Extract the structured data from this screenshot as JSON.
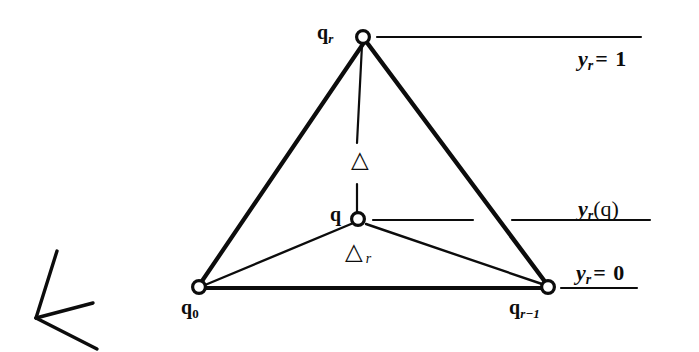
{
  "figure": {
    "background_color": "#ffffff",
    "ink_color": "#0c0c0c"
  },
  "vertices": [
    {
      "id": "q_r",
      "name": "apex-vertex",
      "label_main": "q",
      "label_sub": "r",
      "sub_style": "italic",
      "x": 363,
      "y": 37,
      "label_x": 317,
      "label_y": 22
    },
    {
      "id": "q",
      "name": "interior-vertex",
      "label_main": "q",
      "label_sub": "",
      "sub_style": "none",
      "x": 358,
      "y": 219,
      "label_x": 330,
      "label_y": 204
    },
    {
      "id": "q_0",
      "name": "base-left-vertex",
      "label_main": "q",
      "label_sub": "0",
      "sub_style": "upright",
      "x": 199,
      "y": 287,
      "label_x": 181,
      "label_y": 297
    },
    {
      "id": "q_r-1",
      "name": "base-right-vertex",
      "label_main": "q",
      "label_sub": "r−1",
      "sub_style": "italic",
      "x": 548,
      "y": 287,
      "label_x": 509,
      "label_y": 297
    }
  ],
  "simplex_labels": [
    {
      "id": "delta",
      "name": "simplex-delta-label",
      "glyph": "△",
      "sub": "",
      "x": 351,
      "y": 148
    },
    {
      "id": "delta_r",
      "name": "simplex-delta-r-label",
      "glyph": "△",
      "sub": "r",
      "x": 345,
      "y": 240
    }
  ],
  "level_lines": [
    {
      "id": "y_r_eq_1",
      "name": "level-line-top",
      "label_main": "y",
      "label_sub": "r",
      "label_rest": "= 1",
      "label_x": 578,
      "label_y": 48,
      "segments": [
        {
          "x1": 377,
          "y1": 37,
          "x2": 641,
          "y2": 37
        }
      ]
    },
    {
      "id": "y_r_of_q",
      "name": "level-line-middle",
      "label_main": "y",
      "label_sub": "r",
      "label_rest": "(q)",
      "label_x": 578,
      "label_y": 198,
      "segments": [
        {
          "x1": 373,
          "y1": 220,
          "x2": 473,
          "y2": 220
        },
        {
          "x1": 512,
          "y1": 220,
          "x2": 650,
          "y2": 220
        }
      ]
    },
    {
      "id": "y_r_eq_0",
      "name": "level-line-bottom",
      "label_main": "y",
      "label_sub": "r",
      "label_rest": "= 0",
      "label_x": 576,
      "label_y": 262,
      "segments": [
        {
          "x1": 561,
          "y1": 288,
          "x2": 637,
          "y2": 288
        }
      ]
    }
  ],
  "edges": [
    {
      "id": "edge-left",
      "name": "simplex-edge-left",
      "x1": 363,
      "y1": 44,
      "x2": 200,
      "y2": 284,
      "width": 4.2
    },
    {
      "id": "edge-right",
      "name": "simplex-edge-right",
      "x1": 368,
      "y1": 44,
      "x2": 546,
      "y2": 283,
      "width": 4.4
    },
    {
      "id": "edge-base",
      "name": "simplex-edge-base",
      "x1": 205,
      "y1": 288,
      "x2": 543,
      "y2": 288,
      "width": 4.2
    },
    {
      "id": "edge-q-to-q0",
      "name": "face-edge-q-to-q0",
      "x1": 351,
      "y1": 224,
      "x2": 205,
      "y2": 285,
      "width": 2.4
    },
    {
      "id": "edge-q-to-qr1",
      "name": "face-edge-q-to-qr-1",
      "x1": 366,
      "y1": 224,
      "x2": 542,
      "y2": 284,
      "width": 2.4
    },
    {
      "id": "edge-apex-upper",
      "name": "apex-drop-upper-segment",
      "x1": 362,
      "y1": 45,
      "x2": 357,
      "y2": 143,
      "width": 2.2
    },
    {
      "id": "edge-apex-lower",
      "name": "apex-drop-lower-segment",
      "x1": 357,
      "y1": 184,
      "x2": 357,
      "y2": 212,
      "width": 2.2
    }
  ],
  "vertex_marker": {
    "name": "vertex-circle-marker",
    "radius": 6.4,
    "stroke_width": 3.2,
    "fill": "#ffffff",
    "stroke": "#0c0c0c"
  },
  "pointer_mark": {
    "name": "hand-drawn-arrow-mark",
    "vertex": {
      "x": 36,
      "y": 318
    },
    "strokes": [
      {
        "x1": 36,
        "y1": 318,
        "x2": 57,
        "y2": 251,
        "width": 3.4
      },
      {
        "x1": 36,
        "y1": 318,
        "x2": 93,
        "y2": 303,
        "width": 3.4
      },
      {
        "x1": 36,
        "y1": 318,
        "x2": 97,
        "y2": 349,
        "width": 3.4
      }
    ]
  }
}
